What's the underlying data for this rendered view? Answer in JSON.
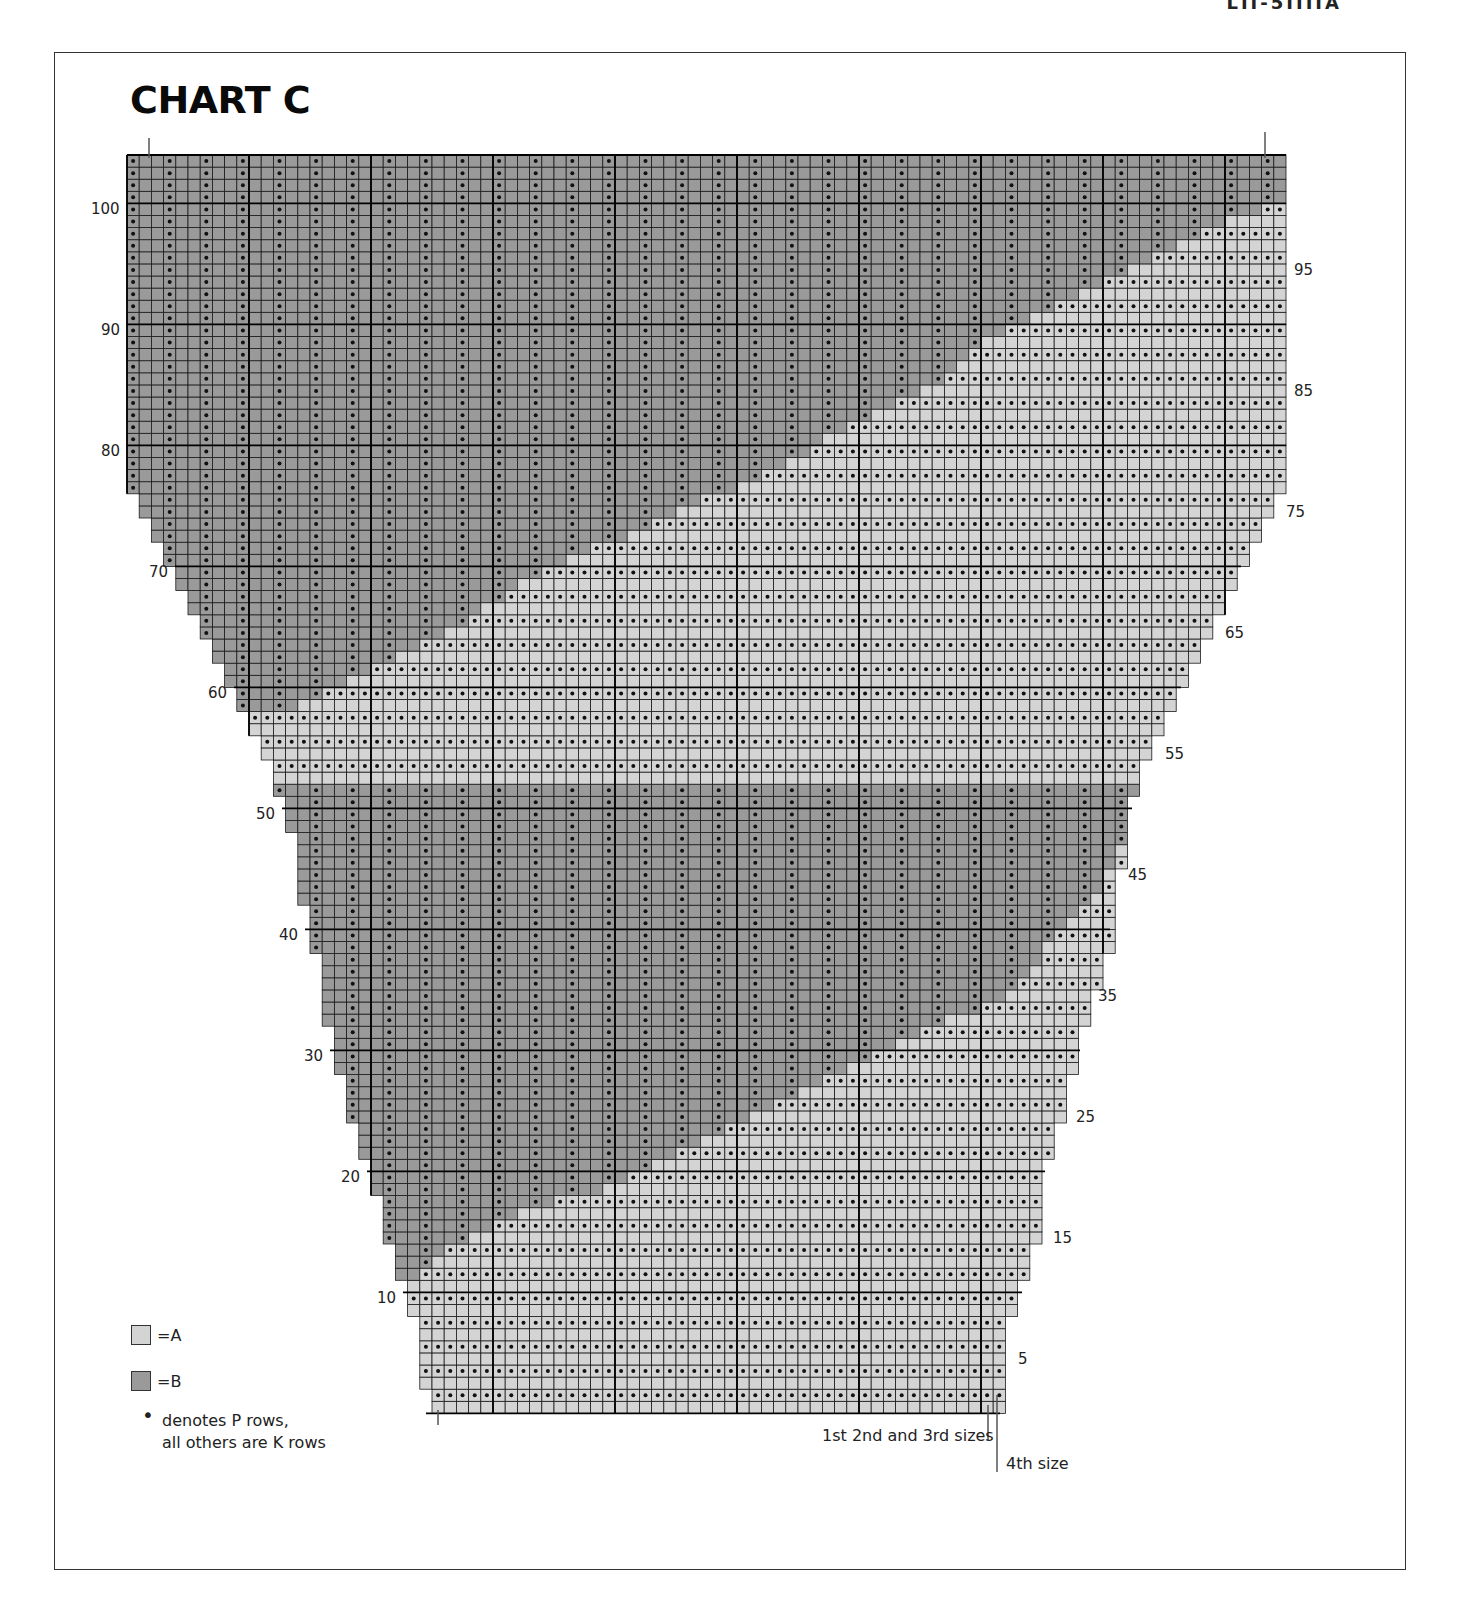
{
  "page": {
    "header_fragment": "LII-5IIIIA",
    "title": "CHART C"
  },
  "colors": {
    "A": "#d4d4d4",
    "B": "#9a9a9a",
    "grid_line": "#1a1a1a",
    "dot": "#111111",
    "frame": "#333333"
  },
  "legend": {
    "items": [
      {
        "key": "A",
        "label": "=A",
        "color": "#d4d4d4"
      },
      {
        "key": "B",
        "label": "=B",
        "color": "#9a9a9a"
      }
    ],
    "note_bullet": "•",
    "note_line1": "denotes P rows,",
    "note_line2": "all others are K rows"
  },
  "size_markers": {
    "sizes_123": "1st 2nd and 3rd sizes",
    "size_4": "4th size"
  },
  "chart_data": {
    "type": "table",
    "title": "CHART C",
    "total_rows": 104,
    "total_columns": 95,
    "row_labels_left": [
      10,
      20,
      30,
      40,
      50,
      60,
      70,
      80,
      90,
      100
    ],
    "row_labels_right": [
      5,
      15,
      25,
      35,
      45,
      55,
      65,
      75,
      85,
      95
    ],
    "grid": {
      "x0": 127,
      "y_top": 155,
      "cell_w": 12.2,
      "cell_h": 12.1
    },
    "row_bounds": [
      {
        "row": 1,
        "left_x": 426,
        "right_x": 1000
      },
      {
        "row": 3,
        "left_x": 414,
        "right_x": 1000
      },
      {
        "row": 5,
        "left_x": 414,
        "right_x": 1010
      },
      {
        "row": 9,
        "left_x": 403,
        "right_x": 1022
      },
      {
        "row": 12,
        "left_x": 391,
        "right_x": 1034
      },
      {
        "row": 15,
        "left_x": 378,
        "right_x": 1045
      },
      {
        "row": 19,
        "left_x": 367,
        "right_x": 1045
      },
      {
        "row": 22,
        "left_x": 355,
        "right_x": 1057
      },
      {
        "row": 25,
        "left_x": 342,
        "right_x": 1068
      },
      {
        "row": 29,
        "left_x": 330,
        "right_x": 1080
      },
      {
        "row": 33,
        "left_x": 318,
        "right_x": 1090
      },
      {
        "row": 36,
        "left_x": 318,
        "right_x": 1098
      },
      {
        "row": 39,
        "left_x": 305,
        "right_x": 1110
      },
      {
        "row": 43,
        "left_x": 294,
        "right_x": 1120
      },
      {
        "row": 46,
        "left_x": 294,
        "right_x": 1132
      },
      {
        "row": 49,
        "left_x": 282,
        "right_x": 1132
      },
      {
        "row": 52,
        "left_x": 270,
        "right_x": 1145
      },
      {
        "row": 55,
        "left_x": 258,
        "right_x": 1157
      },
      {
        "row": 57,
        "left_x": 246,
        "right_x": 1170
      },
      {
        "row": 59,
        "left_x": 234,
        "right_x": 1181
      },
      {
        "row": 61,
        "left_x": 222,
        "right_x": 1193
      },
      {
        "row": 63,
        "left_x": 210,
        "right_x": 1205
      },
      {
        "row": 65,
        "left_x": 199,
        "right_x": 1217
      },
      {
        "row": 67,
        "left_x": 187,
        "right_x": 1229
      },
      {
        "row": 69,
        "left_x": 175,
        "right_x": 1241
      },
      {
        "row": 71,
        "left_x": 163,
        "right_x": 1254
      },
      {
        "row": 73,
        "left_x": 151,
        "right_x": 1266
      },
      {
        "row": 75,
        "left_x": 139,
        "right_x": 1278
      },
      {
        "row": 77,
        "left_x": 127,
        "right_x": 1286
      },
      {
        "row": 104,
        "left_x": 127,
        "right_x": 1286
      }
    ],
    "colour_regions": {
      "note": "B (dark) occupies an upper-left diagonal band (rows ~60-104, boundary running from ~x=300 at row 60 to the right edge at row ~100) and a lower V-shaped band (rows ~10-52). A (light) fills the lower-right and the middle diagonal band.",
      "upper_B_boundary": [
        {
          "row": 59,
          "x": 300
        },
        {
          "row": 62,
          "x": 370
        },
        {
          "row": 65,
          "x": 450
        },
        {
          "row": 70,
          "x": 540
        },
        {
          "row": 74,
          "x": 650
        },
        {
          "row": 78,
          "x": 760
        },
        {
          "row": 82,
          "x": 850
        },
        {
          "row": 86,
          "x": 940
        },
        {
          "row": 90,
          "x": 1000
        },
        {
          "row": 94,
          "x": 1100
        },
        {
          "row": 98,
          "x": 1200
        },
        {
          "row": 101,
          "x": 1286
        }
      ],
      "lower_B_top_row": 52,
      "lower_B_bottom_boundary": [
        {
          "x": 400,
          "row": 11
        },
        {
          "x": 450,
          "row": 14
        },
        {
          "x": 520,
          "row": 17
        },
        {
          "x": 600,
          "row": 19
        },
        {
          "x": 700,
          "row": 23
        },
        {
          "x": 800,
          "row": 27
        },
        {
          "x": 900,
          "row": 31
        },
        {
          "x": 1000,
          "row": 35
        },
        {
          "x": 1060,
          "row": 40
        },
        {
          "x": 1100,
          "row": 44
        },
        {
          "x": 1140,
          "row": 50
        }
      ]
    },
    "dot_rules": {
      "A": "dots on every even-numbered row, every column (purl rows)",
      "B": "dots every other column on every row (rib columns, starting col offset 0)"
    }
  }
}
